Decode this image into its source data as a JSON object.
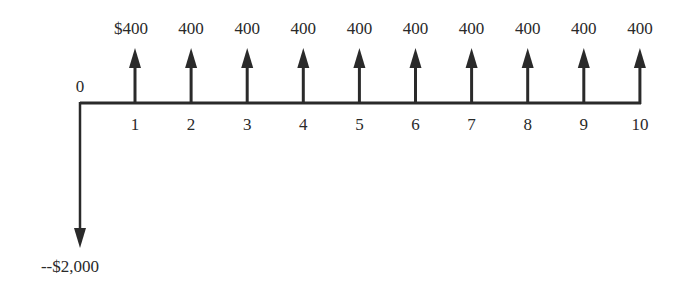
{
  "diagram": {
    "type": "cash-flow-diagram",
    "origin_label": "0",
    "initial_outflow": {
      "period": 0,
      "label": "--$2,000",
      "value": -2000
    },
    "inflows": [
      {
        "period": 1,
        "period_label": "1",
        "amount_label": "$400",
        "value": 400
      },
      {
        "period": 2,
        "period_label": "2",
        "amount_label": "400",
        "value": 400
      },
      {
        "period": 3,
        "period_label": "3",
        "amount_label": "400",
        "value": 400
      },
      {
        "period": 4,
        "period_label": "4",
        "amount_label": "400",
        "value": 400
      },
      {
        "period": 5,
        "period_label": "5",
        "amount_label": "400",
        "value": 400
      },
      {
        "period": 6,
        "period_label": "6",
        "amount_label": "400",
        "value": 400
      },
      {
        "period": 7,
        "period_label": "7",
        "amount_label": "400",
        "value": 400
      },
      {
        "period": 8,
        "period_label": "8",
        "amount_label": "400",
        "value": 400
      },
      {
        "period": 9,
        "period_label": "9",
        "amount_label": "400",
        "value": 400
      },
      {
        "period": 10,
        "period_label": "10",
        "amount_label": "400",
        "value": 400
      }
    ],
    "colors": {
      "line": "#2a2a2a",
      "background": "#ffffff"
    }
  }
}
